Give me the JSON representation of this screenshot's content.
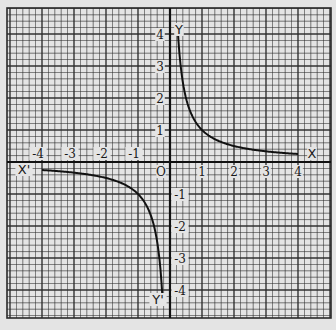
{
  "chart_data": {
    "type": "line",
    "title": "",
    "function": "y = 1/x",
    "xlabel": "X",
    "xlabel_negative": "X'",
    "ylabel": "Y",
    "ylabel_negative": "Y'",
    "origin_label": "O",
    "xlim": [
      -4,
      4
    ],
    "ylim": [
      -4,
      4
    ],
    "grid": true,
    "x_ticks": [
      "-4",
      "-3",
      "-2",
      "-1",
      "1",
      "2",
      "3",
      "4"
    ],
    "y_ticks": [
      "4",
      "3",
      "2",
      "1",
      "-1",
      "-2",
      "-3",
      "-4"
    ],
    "series": [
      {
        "name": "branch-positive",
        "x": [
          0.25,
          0.33,
          0.5,
          0.75,
          1,
          1.5,
          2,
          2.5,
          3,
          3.5,
          4
        ],
        "y": [
          4,
          3,
          2,
          1.33,
          1,
          0.67,
          0.5,
          0.4,
          0.33,
          0.29,
          0.25
        ]
      },
      {
        "name": "branch-negative",
        "x": [
          -4,
          -3.5,
          -3,
          -2.5,
          -2,
          -1.5,
          -1,
          -0.75,
          -0.5,
          -0.33,
          -0.25
        ],
        "y": [
          -0.25,
          -0.29,
          -0.33,
          -0.4,
          -0.5,
          -0.67,
          -1,
          -1.33,
          -2,
          -3,
          -4
        ]
      }
    ]
  },
  "colors": {
    "paper": "#e4e4e4",
    "grid_line": "#2a2a2a",
    "curve": "#111111"
  }
}
